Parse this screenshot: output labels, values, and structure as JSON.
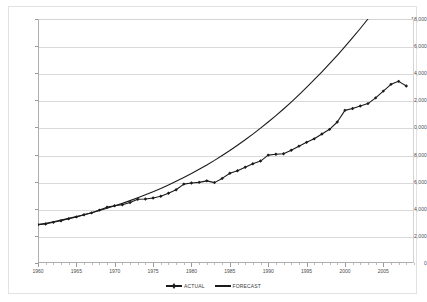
{
  "chart_data": {
    "type": "line",
    "title": "",
    "subtitle": "",
    "xlabel": "",
    "ylabel": "",
    "xlim": [
      1960,
      2009
    ],
    "ylim": [
      0,
      18000
    ],
    "grid": true,
    "legend_position": "bottom-center",
    "y_ticks": [
      0,
      2000,
      4000,
      6000,
      8000,
      10000,
      12000,
      14000,
      16000,
      18000
    ],
    "y_tick_labels": [
      "0",
      "2,000",
      "4,000",
      "6,000",
      "8,000",
      "10,000",
      "12,000",
      "14,000",
      "16,000",
      "18,000"
    ],
    "x_ticks": [
      1960,
      1965,
      1970,
      1975,
      1980,
      1985,
      1990,
      1995,
      2000,
      2005
    ],
    "x_tick_labels": [
      "1960",
      "1965",
      "1970",
      "1975",
      "1980",
      "1985",
      "1990",
      "1995",
      "2000",
      "2005"
    ],
    "x": [
      1960,
      1961,
      1962,
      1963,
      1964,
      1965,
      1966,
      1967,
      1968,
      1969,
      1970,
      1971,
      1972,
      1973,
      1974,
      1975,
      1976,
      1977,
      1978,
      1979,
      1980,
      1981,
      1982,
      1983,
      1984,
      1985,
      1986,
      1987,
      1988,
      1989,
      1990,
      1991,
      1992,
      1993,
      1994,
      1995,
      1996,
      1997,
      1998,
      1999,
      2000,
      2001,
      2002,
      2003,
      2004,
      2005,
      2006,
      2007,
      2008
    ],
    "series": [
      {
        "name": "ACTUAL",
        "marker": "diamond",
        "color": "#1a1a1a",
        "values": [
          2830,
          2880,
          3000,
          3120,
          3260,
          3400,
          3560,
          3700,
          3900,
          4120,
          4220,
          4300,
          4460,
          4700,
          4720,
          4800,
          4920,
          5140,
          5400,
          5820,
          5900,
          5950,
          6060,
          5930,
          6240,
          6620,
          6800,
          7060,
          7320,
          7520,
          7960,
          8020,
          8060,
          8320,
          8620,
          8900,
          9160,
          9520,
          9860,
          10400,
          11260,
          11400,
          11580,
          11760,
          12180,
          12680,
          13180,
          13400,
          13060
        ]
      },
      {
        "name": "FORECAST",
        "marker": "none",
        "color": "#1a1a1a",
        "values": [
          2830,
          2930,
          3040,
          3160,
          3290,
          3420,
          3560,
          3710,
          3870,
          4040,
          4220,
          4400,
          4600,
          4810,
          5030,
          5260,
          5500,
          5760,
          6030,
          6310,
          6600,
          6910,
          7230,
          7570,
          7930,
          8300,
          8690,
          9090,
          9510,
          9950,
          10400,
          10870,
          11360,
          11870,
          12400,
          12950,
          13520,
          14100,
          14700,
          15320,
          15960,
          16620,
          17300,
          18000,
          18720,
          19470,
          20240,
          21040,
          21860
        ]
      }
    ],
    "legend": [
      {
        "label": "ACTUAL",
        "marker": "diamond"
      },
      {
        "label": "FORECAST",
        "marker": "none"
      }
    ]
  }
}
